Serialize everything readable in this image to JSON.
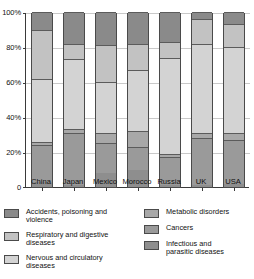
{
  "chart_data": {
    "type": "bar",
    "subtype": "stacked-percentage",
    "title": "",
    "xlabel": "",
    "ylabel": "",
    "ylim": [
      0,
      100
    ],
    "ytick_labels": [
      "0",
      "20%",
      "40%",
      "60%",
      "80%",
      "100%"
    ],
    "ytick_values": [
      0,
      20,
      40,
      60,
      80,
      100
    ],
    "grid": true,
    "legend_position": "below",
    "categories": [
      "China",
      "Japan",
      "Mexico",
      "Morocco",
      "Russia",
      "UK",
      "USA"
    ],
    "series": [
      {
        "name": "Infectious and parasitic diseases",
        "color": "#8e8e8e",
        "values": [
          3,
          1,
          8,
          10,
          1,
          1,
          2
        ]
      },
      {
        "name": "Cancers",
        "color": "#9a9a9a",
        "values": [
          21,
          30,
          17,
          13,
          16,
          27,
          25
        ]
      },
      {
        "name": "Metabolic disorders",
        "color": "#a8a8a8",
        "values": [
          2,
          2,
          6,
          9,
          2,
          3,
          4
        ]
      },
      {
        "name": "Nervous and circulatory diseases",
        "color": "#d3d3d3",
        "values": [
          36,
          40,
          29,
          35,
          55,
          51,
          49
        ]
      },
      {
        "name": "Respiratory and digestive diseases",
        "color": "#c2c2c2",
        "values": [
          28,
          9,
          21,
          15,
          9,
          14,
          13
        ]
      },
      {
        "name": "Accidents, poisoning and violence",
        "color": "#8a8a8a",
        "values": [
          10,
          18,
          19,
          18,
          17,
          4,
          7
        ]
      }
    ],
    "legend": [
      {
        "label": "Accidents, poisoning and violence",
        "color": "#8a8a8a"
      },
      {
        "label": "Respiratory and digestive diseases",
        "color": "#c2c2c2"
      },
      {
        "label": "Nervous and circulatory diseases",
        "color": "#d3d3d3"
      },
      {
        "label": "Metabolic disorders",
        "color": "#a8a8a8"
      },
      {
        "label": "Cancers",
        "color": "#9a9a9a"
      },
      {
        "label": "Infectious and\nparasitic diseases",
        "color": "#8e8e8e"
      }
    ]
  }
}
